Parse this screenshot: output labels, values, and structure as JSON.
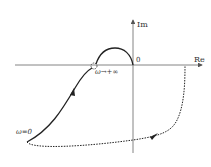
{
  "diagram": {
    "type": "nyquist-plot",
    "axes": {
      "real_label": "Re",
      "imag_label": "Im",
      "origin_label": "0"
    },
    "annotations": {
      "omega_zero": "ω=0",
      "omega_inf": "ω→+∞"
    },
    "colors": {
      "curve": "#222222",
      "axis": "#555555",
      "dashed": "#222222"
    }
  }
}
